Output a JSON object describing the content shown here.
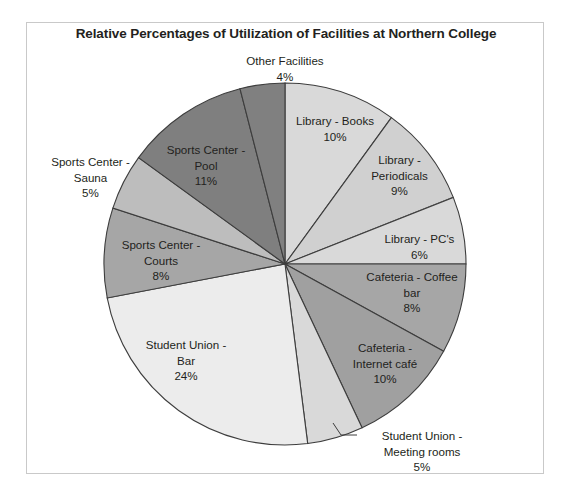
{
  "frame": {
    "border_color": "#c9c9c9"
  },
  "chart_data": {
    "type": "pie",
    "title": "Relative Percentages of Utilization of Facilities at Northern College",
    "xlabel": "",
    "ylabel": "",
    "legend": "none",
    "start_angle_deg": 0,
    "direction": "clockwise",
    "units": "percent",
    "categories": [
      "Library - Books",
      "Library - Periodicals",
      "Library - PC's",
      "Cafeteria - Coffee bar",
      "Cafeteria - Internet café",
      "Student Union - Meeting rooms",
      "Student Union - Bar",
      "Sports Center - Courts",
      "Sports Center - Sauna",
      "Sports Center - Pool",
      "Other Facilities"
    ],
    "values": [
      10,
      9,
      6,
      8,
      10,
      5,
      24,
      8,
      5,
      11,
      4
    ],
    "colors": [
      "#d9d9d9",
      "#d0d0d0",
      "#d9d9d9",
      "#a6a6a6",
      "#a0a0a0",
      "#d9d9d9",
      "#ececec",
      "#a6a6a6",
      "#bdbdbd",
      "#7f7f7f",
      "#808080"
    ],
    "slices": [
      {
        "label": "Library - Books",
        "value": 10,
        "display": "10%",
        "color": "#d9d9d9"
      },
      {
        "label": "Library - Periodicals",
        "value": 9,
        "display": "9%",
        "color": "#d0d0d0"
      },
      {
        "label": "Library - PC's",
        "value": 6,
        "display": "6%",
        "color": "#d9d9d9"
      },
      {
        "label": "Cafeteria - Coffee bar",
        "value": 8,
        "display": "8%",
        "color": "#a6a6a6"
      },
      {
        "label": "Cafeteria - Internet café",
        "value": 10,
        "display": "10%",
        "color": "#a0a0a0"
      },
      {
        "label": "Student Union - Meeting rooms",
        "value": 5,
        "display": "5%",
        "color": "#d9d9d9"
      },
      {
        "label": "Student Union - Bar",
        "value": 24,
        "display": "24%",
        "color": "#ececec"
      },
      {
        "label": "Sports Center - Courts",
        "value": 8,
        "display": "8%",
        "color": "#a6a6a6"
      },
      {
        "label": "Sports Center - Sauna",
        "value": 5,
        "display": "5%",
        "color": "#bdbdbd"
      },
      {
        "label": "Sports Center - Pool",
        "value": 11,
        "display": "11%",
        "color": "#7f7f7f"
      },
      {
        "label": "Other Facilities",
        "value": 4,
        "display": "4%",
        "color": "#808080"
      }
    ]
  },
  "labels": {
    "other_facilities": "Other Facilities\n4%",
    "library_books": "Library - Books\n10%",
    "library_periodicals": "Library -\nPeriodicals\n9%",
    "library_pcs": "Library - PC's\n6%",
    "cafeteria_coffee": "Cafeteria - Coffee\nbar\n8%",
    "cafeteria_internet": "Cafeteria -\nInternet café\n10%",
    "student_union_meeting": "Student Union -\nMeeting rooms\n5%",
    "student_union_bar": "Student Union -\nBar\n24%",
    "sports_courts": "Sports Center -\nCourts\n8%",
    "sports_sauna": "Sports Center -\nSauna\n5%",
    "sports_pool": "Sports Center -\nPool\n11%"
  }
}
